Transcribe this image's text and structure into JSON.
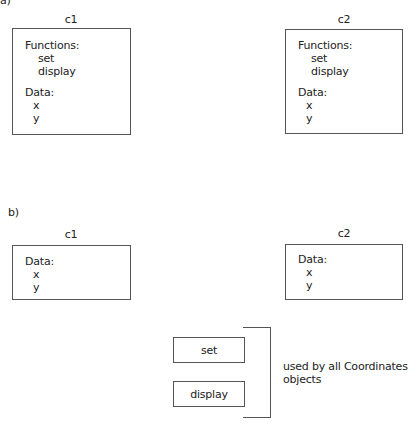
{
  "part_a": {
    "label": "a)",
    "objects": [
      {
        "name": "c1",
        "functions_header": "Functions:",
        "functions": [
          "set",
          "display"
        ],
        "data_header": "Data:",
        "data": [
          "x",
          "y"
        ]
      },
      {
        "name": "c2",
        "functions_header": "Functions:",
        "functions": [
          "set",
          "display"
        ],
        "data_header": "Data:",
        "data": [
          "x",
          "y"
        ]
      }
    ]
  },
  "part_b": {
    "label": "b)",
    "objects": [
      {
        "name": "c1",
        "data_header": "Data:",
        "data": [
          "x",
          "y"
        ]
      },
      {
        "name": "c2",
        "data_header": "Data:",
        "data": [
          "x",
          "y"
        ]
      }
    ],
    "shared_functions": [
      "set",
      "display"
    ],
    "shared_note_line1": "used by all Coordinates",
    "shared_note_line2": "objects"
  }
}
